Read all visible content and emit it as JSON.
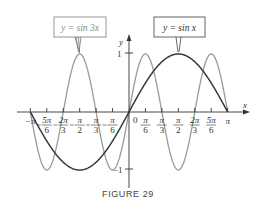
{
  "figure": {
    "caption": "FIGURE 29"
  },
  "chart_data": {
    "type": "line",
    "title": "",
    "xlabel": "x",
    "ylabel": "y",
    "xlim": [
      -3.14159,
      3.14159
    ],
    "ylim": [
      -1,
      1
    ],
    "grid": false,
    "x_ticks": [
      {
        "value": -3.14159,
        "label_num": "−π",
        "label_den": ""
      },
      {
        "value": -2.61799,
        "label_num": "5π",
        "label_den": "6",
        "neg": true
      },
      {
        "value": -2.0944,
        "label_num": "2π",
        "label_den": "3",
        "neg": true
      },
      {
        "value": -1.5708,
        "label_num": "π",
        "label_den": "2",
        "neg": true
      },
      {
        "value": -1.0472,
        "label_num": "π",
        "label_den": "3",
        "neg": true
      },
      {
        "value": -0.5236,
        "label_num": "π",
        "label_den": "6",
        "neg": true
      },
      {
        "value": 0.5236,
        "label_num": "π",
        "label_den": "6"
      },
      {
        "value": 1.0472,
        "label_num": "π",
        "label_den": "3"
      },
      {
        "value": 1.5708,
        "label_num": "π",
        "label_den": "2"
      },
      {
        "value": 2.0944,
        "label_num": "2π",
        "label_den": "3"
      },
      {
        "value": 2.61799,
        "label_num": "5π",
        "label_den": "6"
      },
      {
        "value": 3.14159,
        "label_num": "π",
        "label_den": ""
      }
    ],
    "origin_label": "0",
    "y_ticks": [
      {
        "value": 1,
        "label": "1"
      },
      {
        "value": -1,
        "label": "−1"
      }
    ],
    "series": [
      {
        "name": "y = sin x",
        "function": "sin(x)",
        "color": "#3a3a3a",
        "x_range": [
          -3.14159,
          3.14159
        ]
      },
      {
        "name": "y = sin 3x",
        "function": "sin(3x)",
        "color": "#9a9a9a",
        "x_range": [
          -3.14159,
          3.14159
        ]
      }
    ],
    "annotations": [
      {
        "text": "y = sin 3x",
        "points_to": {
          "x": -2.61799,
          "y": 1
        },
        "box": true
      },
      {
        "text": "y = sin x",
        "points_to": {
          "x": 1.5708,
          "y": 1
        },
        "box": true
      }
    ],
    "legend": "callout boxes"
  }
}
